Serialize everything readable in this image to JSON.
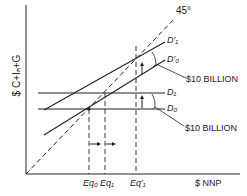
{
  "diagram": {
    "type": "keynesian-cross",
    "y_axis_label": "$ C+Iₙ+G",
    "x_axis_label": "$ NNP",
    "line_45_label": "45°",
    "lines": {
      "D1_prime": "D′₁",
      "D0_prime": "D′₀",
      "D1": "D₁",
      "D0": "D₀"
    },
    "shift_labels": {
      "upper": "$10 BILLION",
      "lower": "$10 BILLION"
    },
    "equilibria": {
      "eq0": "Eq₀",
      "eq1": "Eq₁",
      "eq1_prime": "Eq′₁"
    },
    "colors": {
      "line": "#222222",
      "background": "#ffffff"
    }
  }
}
